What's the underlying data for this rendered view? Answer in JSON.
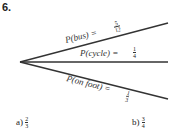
{
  "question_number": "6.",
  "branches": [
    {
      "label": "P(bus) =",
      "num": "5",
      "den": "12"
    },
    {
      "label": "P(cycle) =",
      "num": "1",
      "den": "4"
    },
    {
      "label": "P(on foot) =",
      "num": "1",
      "den": "3"
    }
  ],
  "answers": [
    {
      "label": "a)",
      "num": "2",
      "den": "3"
    },
    {
      "label": "b)",
      "num": "3",
      "den": "4"
    }
  ]
}
